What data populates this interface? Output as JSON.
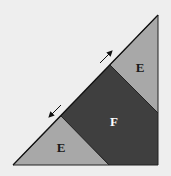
{
  "diagram": {
    "background": "#eeeeee",
    "shapes": [
      {
        "id": "upper-E",
        "label": "E",
        "fill": "#a8a8a8",
        "points": "110,65 158,15 158,113",
        "label_pos": [
          140,
          70
        ],
        "label_color": "#1a1a1a"
      },
      {
        "id": "F",
        "label": "F",
        "fill": "#3f3f3f",
        "points": "110,65 158,113 158,165 109,165 61,116",
        "label_pos": [
          114,
          124
        ],
        "label_color": "#ffffff"
      },
      {
        "id": "lower-E",
        "label": "E",
        "fill": "#a8a8a8",
        "points": "13,165 61,116 109,165",
        "label_pos": [
          61,
          152
        ],
        "label_color": "#1a1a1a"
      }
    ],
    "arrows": [
      {
        "id": "arrow-up-right",
        "direction": "up-right",
        "from": [
          100,
          63
        ],
        "to": [
          112,
          51
        ]
      },
      {
        "id": "arrow-down-left",
        "direction": "down-left",
        "from": [
          61,
          105
        ],
        "to": [
          49,
          117
        ]
      }
    ]
  }
}
